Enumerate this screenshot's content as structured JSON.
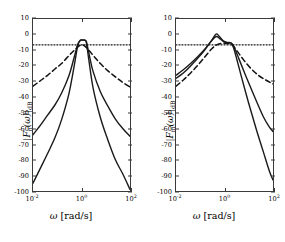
{
  "figure": {
    "background": "#ffffff",
    "panel_count": 2
  },
  "axes": {
    "y": {
      "min": -100,
      "max": 10,
      "ticks": [
        10,
        0,
        -10,
        -20,
        -30,
        -40,
        -50,
        -60,
        -70,
        -80,
        -90,
        -100
      ],
      "tick_labels": [
        "10",
        "0",
        "-10",
        "-20",
        "-30",
        "-40",
        "-50",
        "-60",
        "-70",
        "-80",
        "-90",
        "-100"
      ]
    },
    "x": {
      "scale": "log",
      "min": 0.01,
      "max": 100,
      "ticks": [
        0.01,
        1,
        100
      ],
      "tick_labels": [
        "10-2",
        "100",
        "102"
      ],
      "tick_mantissa": [
        "10",
        "10",
        "10"
      ],
      "tick_exponents": [
        "-2",
        "0",
        "2"
      ],
      "label_symbol": "ω",
      "label_units": "[rad/s]"
    }
  },
  "panels": [
    {
      "id": "left",
      "ylabel_symbol": "F",
      "ylabel_subscript": "n",
      "ylabel_arg": "(ω)",
      "ylabel_units": "dB",
      "ylabel_text": "|F_n(ω)|_dB",
      "chart_data": {
        "type": "line",
        "title": "",
        "xlabel": "ω [rad/s]",
        "ylabel": "|F_n(ω)|_dB",
        "xscale": "log",
        "xlim": [
          0.01,
          100
        ],
        "ylim": [
          -100,
          10
        ],
        "grid": false,
        "legend": "none",
        "series": [
          {
            "name": "narrow-band solid (steep)",
            "style": "solid",
            "color": "#1a1a1a",
            "width": 1.4,
            "x": [
              0.01,
              0.02,
              0.04,
              0.08,
              0.15,
              0.3,
              0.5,
              0.7,
              0.9,
              1.1,
              1.4,
              1.6,
              2.0,
              3.0,
              6.0,
              12.0,
              25.0,
              50.0,
              100.0
            ],
            "y": [
              -95.0,
              -85.5,
              -76.0,
              -66.0,
              -54.5,
              -38.0,
              -20.0,
              -7.0,
              -3.6,
              -3.5,
              -3.6,
              -5.5,
              -16.0,
              -34.0,
              -53.0,
              -67.0,
              -80.0,
              -89.0,
              -99.0
            ]
          },
          {
            "name": "narrow-band solid (shallow)",
            "style": "solid",
            "color": "#1a1a1a",
            "width": 1.4,
            "x": [
              0.01,
              0.02,
              0.04,
              0.08,
              0.15,
              0.3,
              0.5,
              0.7,
              0.9,
              1.1,
              1.4,
              1.6,
              2.0,
              3.0,
              6.0,
              12.0,
              25.0,
              50.0,
              100.0
            ],
            "y": [
              -64.0,
              -58.0,
              -51.5,
              -45.0,
              -37.5,
              -26.5,
              -14.5,
              -6.2,
              -3.6,
              -3.5,
              -3.6,
              -4.6,
              -11.5,
              -23.5,
              -36.5,
              -45.5,
              -54.0,
              -60.0,
              -65.0
            ]
          },
          {
            "name": "wide-band dashed",
            "style": "dashed",
            "color": "#111111",
            "width": 1.5,
            "x": [
              0.01,
              0.02,
              0.04,
              0.08,
              0.15,
              0.3,
              0.5,
              0.8,
              1.0,
              1.3,
              2.0,
              3.5,
              6.0,
              12.0,
              25.0,
              50.0,
              100.0
            ],
            "y": [
              -33.0,
              -29.5,
              -26.0,
              -22.0,
              -18.5,
              -13.5,
              -10.0,
              -7.2,
              -6.6,
              -7.0,
              -10.0,
              -14.5,
              -18.5,
              -23.0,
              -27.0,
              -30.5,
              -33.5
            ]
          },
          {
            "name": "reference level dotted",
            "style": "dotted",
            "color": "#1a1a1a",
            "width": 1.2,
            "constant_y": -6.5,
            "x": [
              0.01,
              100
            ],
            "y": [
              -6.5,
              -6.5
            ]
          }
        ]
      }
    },
    {
      "id": "right",
      "ylabel_symbol": "F",
      "ylabel_subscript": "m",
      "ylabel_arg": "(ω)",
      "ylabel_units": "dB",
      "ylabel_text": "|F_m(ω)|_dB",
      "chart_data": {
        "type": "line",
        "title": "",
        "xlabel": "ω [rad/s]",
        "ylabel": "|F_m(ω)|_dB",
        "xscale": "log",
        "xlim": [
          0.01,
          100
        ],
        "ylim": [
          -100,
          10
        ],
        "grid": false,
        "legend": "none",
        "series": [
          {
            "name": "asymmetric solid (steep)",
            "style": "solid",
            "color": "#1a1a1a",
            "width": 1.4,
            "x": [
              0.01,
              0.02,
              0.04,
              0.08,
              0.15,
              0.3,
              0.45,
              0.6,
              0.9,
              1.3,
              1.8,
              2.2,
              3.0,
              5.0,
              10.0,
              20.0,
              40.0,
              70.0,
              100.0
            ],
            "y": [
              -28.0,
              -24.5,
              -20.0,
              -15.0,
              -10.0,
              -3.5,
              0.4,
              -1.0,
              -4.0,
              -5.0,
              -5.2,
              -7.0,
              -14.0,
              -27.0,
              -44.0,
              -60.0,
              -75.0,
              -87.0,
              -93.0
            ]
          },
          {
            "name": "asymmetric solid (shallow)",
            "style": "solid",
            "color": "#1a1a1a",
            "width": 1.4,
            "x": [
              0.01,
              0.02,
              0.04,
              0.08,
              0.15,
              0.3,
              0.45,
              0.6,
              0.9,
              1.3,
              1.8,
              2.2,
              3.0,
              5.0,
              10.0,
              20.0,
              40.0,
              70.0,
              100.0
            ],
            "y": [
              -26.0,
              -22.5,
              -18.5,
              -14.0,
              -9.5,
              -3.8,
              -1.2,
              -2.2,
              -4.4,
              -5.1,
              -5.3,
              -6.4,
              -11.0,
              -19.5,
              -31.0,
              -42.0,
              -52.5,
              -59.0,
              -62.0
            ]
          },
          {
            "name": "asymmetric dashed",
            "style": "dashed",
            "color": "#111111",
            "width": 1.5,
            "x": [
              0.01,
              0.02,
              0.04,
              0.08,
              0.15,
              0.3,
              0.5,
              0.8,
              1.2,
              1.8,
              2.4,
              3.5,
              6.0,
              12.0,
              25.0,
              50.0,
              100.0
            ],
            "y": [
              -33.0,
              -29.0,
              -24.5,
              -19.5,
              -14.5,
              -9.0,
              -6.4,
              -5.6,
              -5.6,
              -6.0,
              -7.6,
              -11.0,
              -16.0,
              -21.5,
              -26.0,
              -29.0,
              -31.5
            ]
          },
          {
            "name": "reference level dotted",
            "style": "dotted",
            "color": "#1a1a1a",
            "width": 1.2,
            "constant_y": -6.5,
            "x": [
              0.01,
              100
            ],
            "y": [
              -6.5,
              -6.5
            ]
          }
        ]
      }
    }
  ]
}
